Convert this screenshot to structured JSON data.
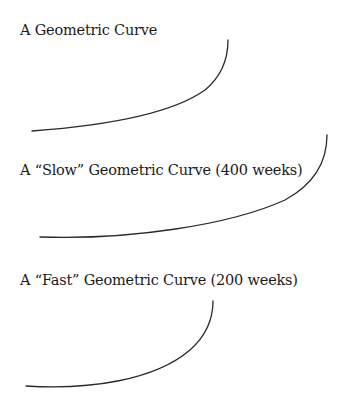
{
  "diagrams": [
    {
      "title": "A Geometric Curve",
      "curve": {
        "start": [
          32,
          131
        ],
        "end": [
          228,
          40
        ],
        "shape": "convex-upward"
      }
    },
    {
      "title": "A “Slow” Geometric Curve (400 weeks)",
      "curve": {
        "start": [
          40,
          237
        ],
        "end": [
          327,
          135
        ],
        "shape": "convex-upward"
      }
    },
    {
      "title": "A “Fast” Geometric Curve (200 weeks)",
      "curve": {
        "start": [
          26,
          386
        ],
        "end": [
          213,
          301
        ],
        "shape": "convex-upward"
      }
    }
  ],
  "colors": {
    "background": "#ffffff",
    "text": "#1a1a1a",
    "curve_stroke": "#2a2a2a"
  }
}
